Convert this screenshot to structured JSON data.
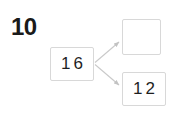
{
  "page": {
    "background_color": "#ffffff",
    "width": 182,
    "height": 117
  },
  "item_number": {
    "label": "10",
    "color": "#1a1a1a"
  },
  "diagram": {
    "type": "number-bond",
    "border_color": "#d8d8d8",
    "arrow_color": "#c9c9c9",
    "nodes": [
      {
        "id": "source",
        "role": "whole",
        "value": "16",
        "empty": false
      },
      {
        "id": "target-empty",
        "role": "part",
        "value": "",
        "empty": true
      },
      {
        "id": "target-filled",
        "role": "part",
        "value": "12",
        "empty": false
      }
    ],
    "arrows": [
      {
        "id": "arrow-to-empty",
        "from": "source",
        "to": "target-empty"
      },
      {
        "id": "arrow-to-filled",
        "from": "source",
        "to": "target-filled"
      }
    ]
  }
}
